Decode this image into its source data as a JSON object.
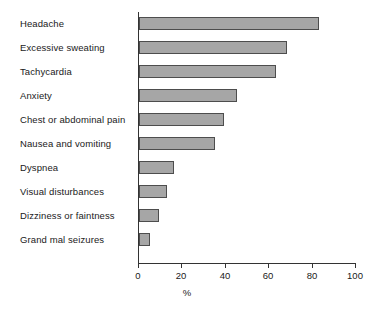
{
  "chart_data": {
    "type": "bar",
    "orientation": "horizontal",
    "title": "",
    "xlabel": "%",
    "ylabel": "",
    "xlim": [
      0,
      100
    ],
    "xticks": [
      0,
      20,
      40,
      60,
      80,
      100
    ],
    "grid": false,
    "legend": null,
    "categories": [
      "Headache",
      "Excessive sweating",
      "Tachycardia",
      "Anxiety",
      "Chest or abdominal pain",
      "Nausea and vomiting",
      "Dyspnea",
      "Visual disturbances",
      "Dizziness or faintness",
      "Grand mal seizures"
    ],
    "values": [
      83,
      68,
      63,
      45,
      39,
      35,
      16,
      13,
      9,
      5
    ],
    "bar_fill_color": "#a6a6a6",
    "bar_border_color": "#4d4d4d",
    "axis_color": "#333333"
  },
  "axis": {
    "x_title": "%",
    "tick_labels": [
      "0",
      "20",
      "40",
      "60",
      "80",
      "100"
    ]
  }
}
